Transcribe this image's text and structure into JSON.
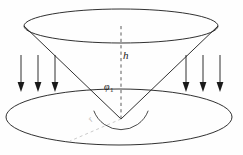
{
  "figure": {
    "type": "geometric-diagram",
    "background_color": "#fefefe",
    "stroke_color": "#1a1a1a",
    "faint_stroke_color": "#bdbdbd",
    "labels": {
      "height": "h",
      "angle": "φ",
      "angle_subscript": "1",
      "radius": "r"
    },
    "geometry": {
      "top_ellipse": {
        "cx": 121,
        "cy": 26,
        "rx": 97,
        "ry": 17
      },
      "bottom_ellipse": {
        "cx": 119,
        "cy": 117,
        "rx": 113,
        "ry": 28
      },
      "apex": {
        "x": 121,
        "y": 119
      },
      "cone_left_edge": {
        "x1": 24,
        "y1": 26,
        "x2": 121,
        "y2": 119
      },
      "cone_right_edge": {
        "x1": 218,
        "y1": 26,
        "x2": 121,
        "y2": 119
      },
      "height_line": {
        "x1": 121,
        "y1": 26,
        "x2": 121,
        "y2": 119,
        "style": "dashed"
      },
      "radius_line": {
        "x1": 121,
        "y1": 119,
        "x2": 70,
        "y2": 140,
        "style": "dashed",
        "faint": true
      },
      "angle_arc": {
        "cx": 121,
        "cy": 119,
        "r": 27
      }
    },
    "arrows": {
      "direction": "down",
      "left_group_x": [
        21,
        38,
        55
      ],
      "right_group_x": [
        186,
        203,
        220
      ],
      "y_start": 55,
      "y_end": 92
    }
  }
}
